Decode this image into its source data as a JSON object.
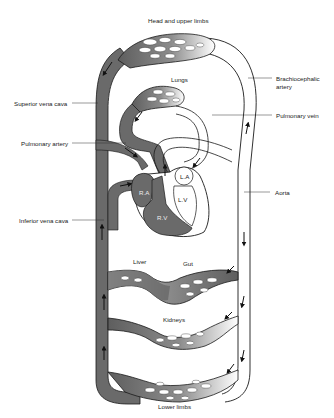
{
  "diagram": {
    "labels": {
      "head": "Head and upper limbs",
      "lungs": "Lungs",
      "brachiocephalic_1": "Brachiocephalic",
      "brachiocephalic_2": "artery",
      "superior_vena_cava": "Superior vena cava",
      "pulmonary_vein": "Pulmonary vein",
      "pulmonary_artery": "Pulmonary artery",
      "aorta": "Aorta",
      "inferior_vena_cava": "Inferior vena cava",
      "liver": "Liver",
      "gut": "Gut",
      "kidneys": "Kidneys",
      "lower_limbs": "Lower limbs",
      "ra": "R.A",
      "la": "L.A",
      "rv": "R.V",
      "lv": "L.V"
    },
    "colors": {
      "deoxygenated": "#6a6a6a",
      "oxygenated": "#ffffff",
      "outline": "#1a1a1a"
    }
  }
}
